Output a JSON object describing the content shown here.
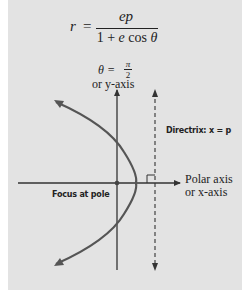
{
  "formula": {
    "lhs": "r",
    "equals": "=",
    "numerator": "ep",
    "denominator_parts": [
      "1 + ",
      "e",
      " cos ",
      "θ"
    ]
  },
  "labels": {
    "theta_label": "θ = π/2",
    "theta_symbol": "θ =",
    "pi": "π",
    "two": "2",
    "y_axis_label": "or y-axis",
    "directrix_label": "Directrix: x = p",
    "polar_axis_line1": "Polar axis",
    "polar_axis_line2": "or x-axis",
    "focus_label": "Focus at pole"
  },
  "colors": {
    "background": "#e3e3e3",
    "curve": "#555555",
    "axis": "#333333",
    "text": "#222222"
  }
}
